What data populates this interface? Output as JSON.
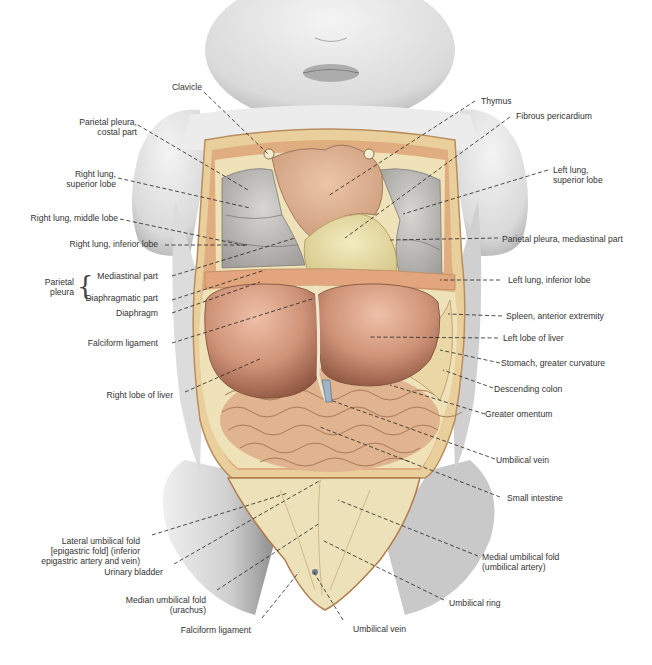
{
  "figure": {
    "labels_left": [
      {
        "id": "clavicle",
        "text": "Clavicle"
      },
      {
        "id": "parietal-pleura-costal",
        "text": "Parietal pleura,\ncostal part"
      },
      {
        "id": "right-lung-superior",
        "text": "Right lung,\nsuperior lobe"
      },
      {
        "id": "right-lung-middle",
        "text": "Right lung, middle lobe"
      },
      {
        "id": "right-lung-inferior",
        "text": "Right lung, inferior lobe"
      },
      {
        "id": "parietal-pleura-group",
        "text": "Parietal\npleura"
      },
      {
        "id": "mediastinal-part",
        "text": "Mediastinal part"
      },
      {
        "id": "diaphragmatic-part",
        "text": "Diaphragmatic part"
      },
      {
        "id": "diaphragm",
        "text": "Diaphragm"
      },
      {
        "id": "falciform-ligament-upper",
        "text": "Falciform ligament"
      },
      {
        "id": "right-lobe-liver",
        "text": "Right lobe of liver"
      },
      {
        "id": "lateral-umbilical-fold",
        "text": "Lateral umbilical fold\n[epigastric fold] (inferior\nepigastric artery and vein)"
      },
      {
        "id": "urinary-bladder",
        "text": "Urinary bladder"
      },
      {
        "id": "median-umbilical-fold",
        "text": "Median umbilical fold\n(urachus)"
      },
      {
        "id": "falciform-ligament-lower",
        "text": "Falciform ligament"
      }
    ],
    "labels_right": [
      {
        "id": "thymus",
        "text": "Thymus"
      },
      {
        "id": "fibrous-pericardium",
        "text": "Fibrous pericardium"
      },
      {
        "id": "left-lung-superior",
        "text": "Left lung,\nsuperior lobe"
      },
      {
        "id": "parietal-pleura-mediastinal",
        "text": "Parietal pleura, mediastinal part"
      },
      {
        "id": "left-lung-inferior",
        "text": "Left lung, inferior lobe"
      },
      {
        "id": "spleen",
        "text": "Spleen, anterior extremity"
      },
      {
        "id": "left-lobe-liver",
        "text": "Left lobe of liver"
      },
      {
        "id": "stomach",
        "text": "Stomach, greater curvature"
      },
      {
        "id": "descending-colon",
        "text": "Descending colon"
      },
      {
        "id": "greater-omentum",
        "text": "Greater omentum"
      },
      {
        "id": "umbilical-vein-right",
        "text": "Umbilical vein"
      },
      {
        "id": "small-intestine",
        "text": "Small intestine"
      },
      {
        "id": "medial-umbilical-fold",
        "text": "Medial umbilical fold\n(umbilical artery)"
      },
      {
        "id": "umbilical-ring",
        "text": "Umbilical ring"
      },
      {
        "id": "umbilical-vein-bottom",
        "text": "Umbilical vein"
      }
    ],
    "colors": {
      "skin": "#e4e4e4",
      "skin_shadow": "#b9b9b9",
      "body_wall": "#e9cf9c",
      "muscle": "#d9926a",
      "lung": "#b8b6b2",
      "thymus": "#dcae8c",
      "pericardium": "#e8dfa8",
      "liver": "#c98a6c",
      "liver_light": "#e8b8a0",
      "intestine": "#e2b896",
      "peritoneum": "#efe2b8",
      "leader": "#222222",
      "text": "#333333"
    }
  }
}
